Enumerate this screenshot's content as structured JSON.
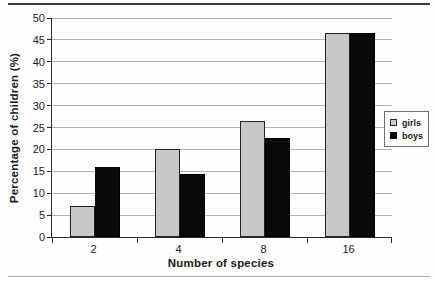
{
  "chart_data": {
    "type": "bar",
    "title": "",
    "xlabel": "Number of species",
    "ylabel": "Percentage of children (%)",
    "categories": [
      "2",
      "4",
      "8",
      "16"
    ],
    "series": [
      {
        "name": "girls",
        "color": "#c8c8c8",
        "values": [
          7,
          20,
          26.5,
          46.5
        ]
      },
      {
        "name": "boys",
        "color": "#0a0a0a",
        "values": [
          16,
          14.5,
          22.5,
          46.5
        ]
      }
    ],
    "ylim": [
      0,
      50
    ],
    "ytick_step": 5,
    "grid": true,
    "legend_position": "right",
    "bar_border_color": "#222222",
    "gridline_color": "#b3b3b3"
  }
}
